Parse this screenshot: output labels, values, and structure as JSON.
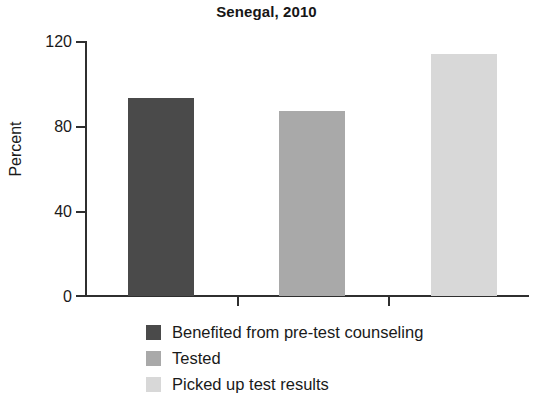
{
  "chart_data": {
    "type": "bar",
    "title": "Senegal, 2010",
    "xlabel": "",
    "ylabel": "Percent",
    "ylim": [
      0,
      120
    ],
    "yticks": [
      0,
      40,
      80,
      120
    ],
    "ytick_labels": [
      "0",
      "40",
      "80",
      "120"
    ],
    "grid": false,
    "legend_position": "below",
    "categories": [
      "Benefited from pre-test counseling",
      "Tested",
      "Picked up test results"
    ],
    "values": [
      93,
      87,
      114
    ],
    "series": [
      {
        "name": "Senegal, 2010",
        "values": [
          93,
          87,
          114
        ]
      }
    ],
    "bars": [
      {
        "label": "Benefited from pre-test counseling",
        "value": 93,
        "color": "#4a4a4a"
      },
      {
        "label": "Tested",
        "value": 87,
        "color": "#a9a9a9"
      },
      {
        "label": "Picked up test results",
        "value": 114,
        "color": "#d8d8d8"
      }
    ],
    "legend": [
      {
        "label": "Benefited from pre-test counseling",
        "color": "#4a4a4a"
      },
      {
        "label": "Tested",
        "color": "#a9a9a9"
      },
      {
        "label": "Picked up test results",
        "color": "#d8d8d8"
      }
    ],
    "colors": {
      "axis": "#2f2f2f",
      "text": "#1a1a1a",
      "background": "#ffffff",
      "bar_dark": "#4a4a4a",
      "bar_medium": "#a9a9a9",
      "bar_light": "#d8d8d8"
    }
  }
}
